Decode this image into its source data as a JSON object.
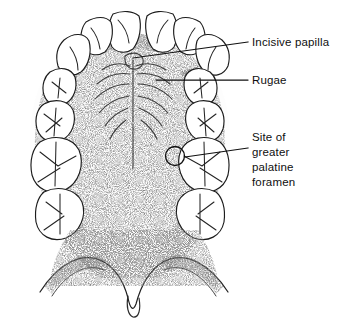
{
  "figure": {
    "background_color": "#ffffff",
    "ink_color": "#1c1c1c",
    "width": 342,
    "height": 332
  },
  "labels": [
    {
      "id": "incisive-papilla",
      "text": "Incisive papilla",
      "lines": [
        "Incisive papilla"
      ],
      "text_x": 252,
      "text_y": 46,
      "leader": {
        "x1": 133,
        "y1": 58,
        "x2": 248,
        "y2": 42
      }
    },
    {
      "id": "rugae",
      "text": "Rugae",
      "lines": [
        "Rugae"
      ],
      "text_x": 252,
      "text_y": 84,
      "leader": {
        "x1": 156,
        "y1": 80,
        "x2": 248,
        "y2": 80
      }
    },
    {
      "id": "greater-palatine-foramen",
      "text": "Site of greater palatine foramen",
      "lines": [
        "Site of",
        "greater",
        "palatine",
        "foramen"
      ],
      "text_x": 252,
      "text_y": 141,
      "line_height": 15,
      "leader": {
        "x1": 185,
        "y1": 157,
        "x2": 248,
        "y2": 148
      },
      "marker": {
        "cx": 175,
        "cy": 156,
        "r": 9.5
      }
    }
  ],
  "anatomy": {
    "structures": [
      "maxillary teeth arch",
      "incisive papilla",
      "palatine rugae",
      "median palatine raphe",
      "hard palate",
      "greater palatine foramen site",
      "soft palate",
      "uvula",
      "maxillary tuberosity"
    ],
    "tooth_count_visible": 16
  }
}
